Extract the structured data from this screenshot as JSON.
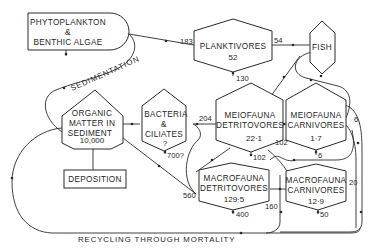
{
  "diagram": {
    "nodes": {
      "phyto": {
        "line1": "PHYTOPLANKTON",
        "line2": "&",
        "line3": "BENTHIC  ALGAE"
      },
      "planktivores": {
        "label": "PLANKTIVORES",
        "value": "52"
      },
      "fish": {
        "label": "FISH"
      },
      "organic": {
        "line1": "ORGANIC",
        "line2": "MATTER  IN",
        "line3": "SEDIMENT",
        "value": "10,000"
      },
      "deposition": {
        "label": "DEPOSITION"
      },
      "bacteria": {
        "line1": "BACTERIA",
        "line2": "&",
        "line3": "CILIATES",
        "value": "?"
      },
      "meio_detr": {
        "line1": "MEIOFAUNA",
        "line2": "DETRITOVORES",
        "value": "22·1"
      },
      "meio_carn": {
        "line1": "MEIOFAUNA",
        "line2": "CARNIVORES",
        "value": "1·7"
      },
      "macro_detr": {
        "line1": "MACROFAUNA",
        "line2": "DETRITOVORES",
        "value": "129·5"
      },
      "macro_carn": {
        "line1": "MACROFAUNA",
        "line2": "CARNIVORES",
        "value": "12·9"
      }
    },
    "flows": {
      "phyto_to_plank": "183",
      "plank_to_fish": "54",
      "plank_loss": "130",
      "bact_to_meio": "204",
      "bact_loss": "700?",
      "meio_detr_loss": "102",
      "meio_detr_to_carn": "102",
      "meio_carn_loss": "6",
      "meio_carn_to_fish": "6",
      "macro_detr_in": "560",
      "macro_detr_loss": "400",
      "macro_detr_to_carn": "160",
      "macro_carn_in": "20",
      "macro_carn_loss": "50"
    },
    "labels": {
      "sedimentation": "SEDIMENTATION",
      "recycling": "RECYCLING   THROUGH   MORTALITY"
    }
  }
}
